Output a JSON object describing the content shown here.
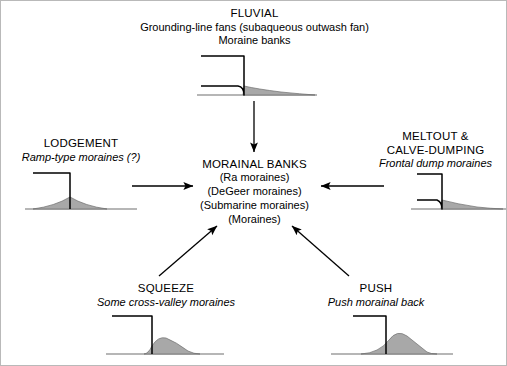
{
  "figure": {
    "background_color": "#ffffff",
    "line_color": "#000000",
    "sediment_fill": "#a8a8a8",
    "ground_color": "#6e6e6e"
  },
  "center": {
    "title": "MORAINAL BANKS",
    "line2": "(Ra moraines)",
    "line3": "(DeGeer moraines)",
    "line4": "(Submarine moraines)",
    "line5": "(Moraines)"
  },
  "nodes": {
    "fluvial": {
      "title": "FLUVIAL",
      "line2": "Grounding-line fans (subaqueous outwash fan)",
      "line3": "Moraine banks"
    },
    "lodgement": {
      "title": "LODGEMENT",
      "line2": "Ramp-type moraines (?)"
    },
    "meltout": {
      "title": "MELTOUT &",
      "title2": "CALVE-DUMPING",
      "line2": "Frontal dump moraines"
    },
    "squeeze": {
      "title": "SQUEEZE",
      "line2": "Some cross-valley moraines"
    },
    "push": {
      "title": "PUSH",
      "line2": "Push morainal back"
    }
  },
  "arrows": {
    "top_to_center": "arrow-down",
    "left_to_center": "arrow-right",
    "right_to_center": "arrow-left",
    "bottom_left_to_center": "arrow-up-right",
    "bottom_right_to_center": "arrow-up-left"
  }
}
